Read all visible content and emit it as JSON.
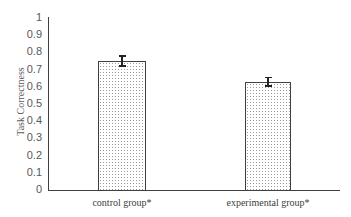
{
  "chart_data": {
    "type": "bar",
    "title": "",
    "xlabel": "",
    "ylabel": "Task Correctness",
    "categories": [
      "control group*",
      "experimental group*"
    ],
    "values": [
      0.75,
      0.63
    ],
    "error": [
      0.03,
      0.025
    ],
    "ylim": [
      0,
      1
    ],
    "yticks": [
      "0",
      "0.1",
      "0.2",
      "0.3",
      "0.4",
      "0.5",
      "0.6",
      "0.7",
      "0.8",
      "0.9",
      "1"
    ],
    "grid": false,
    "legend": null,
    "bar_fill": "dotted",
    "colors": {
      "axis": "#404040",
      "bar_border": "#404040",
      "dots": "#9a9a9a",
      "text": "#595959"
    }
  }
}
